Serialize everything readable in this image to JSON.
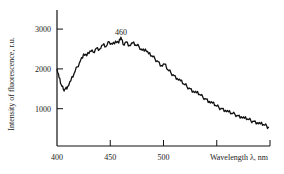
{
  "chart_data": {
    "type": "line",
    "title": "",
    "xlabel": "Wavelength λ, nm",
    "ylabel": "Intensity of fluorescence, r.u.",
    "xlim": [
      400,
      600
    ],
    "ylim": [
      0,
      3450
    ],
    "x_ticks": [
      400,
      450,
      500,
      550,
      600
    ],
    "x_tick_labels": [
      "400",
      "450",
      "500",
      "",
      ""
    ],
    "y_ticks": [
      1000,
      2000,
      3000
    ],
    "y_tick_labels": [
      "1000",
      "2000",
      "3000"
    ],
    "grid": false,
    "legend": null,
    "annotations": [
      {
        "text": "460",
        "x": 460,
        "y": 2900
      }
    ],
    "series": [
      {
        "name": "fluorescence spectrum",
        "x": [
          400,
          402,
          404,
          406,
          408,
          410,
          413,
          416,
          419,
          422,
          425,
          428,
          431,
          434,
          437,
          440,
          443,
          446,
          449,
          452,
          455,
          458,
          460,
          462,
          465,
          468,
          471,
          474,
          477,
          480,
          483,
          486,
          489,
          492,
          495,
          498,
          501,
          504,
          507,
          510,
          513,
          516,
          519,
          522,
          525,
          528,
          531,
          534,
          537,
          540,
          543,
          546,
          549,
          552,
          555,
          558,
          561,
          564,
          567,
          570,
          573,
          576,
          579,
          582,
          585,
          588,
          591,
          594,
          597,
          599
        ],
        "y": [
          2000,
          1780,
          1600,
          1480,
          1500,
          1560,
          1700,
          1880,
          2050,
          2200,
          2380,
          2330,
          2450,
          2420,
          2520,
          2500,
          2600,
          2560,
          2680,
          2620,
          2700,
          2650,
          2800,
          2620,
          2680,
          2590,
          2650,
          2600,
          2560,
          2470,
          2500,
          2380,
          2330,
          2250,
          2180,
          2080,
          2120,
          1980,
          1900,
          1830,
          1760,
          1700,
          1620,
          1560,
          1500,
          1440,
          1400,
          1360,
          1290,
          1240,
          1180,
          1140,
          1080,
          1030,
          1000,
          960,
          920,
          880,
          860,
          820,
          800,
          760,
          740,
          700,
          680,
          650,
          620,
          600,
          560,
          520
        ]
      }
    ]
  }
}
